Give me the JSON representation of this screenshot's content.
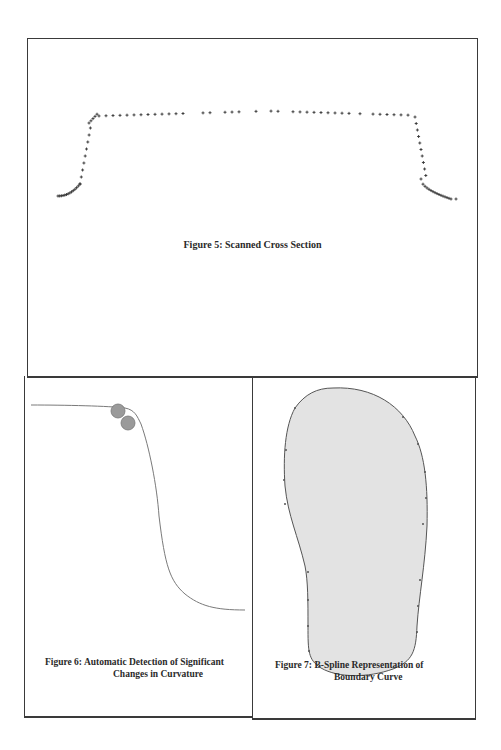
{
  "figures": {
    "fig5": {
      "caption": "Figure 5: Scanned Cross Section"
    },
    "fig6": {
      "caption_line1": "Figure 6: Automatic Detection of Significant",
      "caption_line2": "Changes in Curvature"
    },
    "fig7": {
      "caption_line1": "Figure 7: B-Spline Representation of",
      "caption_line2": "Boundary Curve"
    }
  },
  "colors": {
    "frame": "#3a3a3a",
    "points": "#333333",
    "curve": "#7a7a7a",
    "marker_fill": "#9a9a9a",
    "shape_fill": "#e3e3e3",
    "shape_stroke": "#555555"
  }
}
